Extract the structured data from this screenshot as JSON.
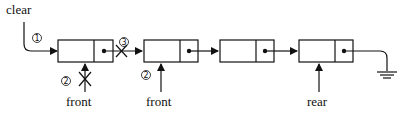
{
  "diagram": {
    "type": "linked-queue-clear",
    "pointer_labels": {
      "clear": "clear",
      "front_old": "front",
      "front_new": "front",
      "rear": "rear"
    },
    "step_markers": {
      "step1": "1",
      "step2_old": "2",
      "step2_new": "2",
      "step3": "3"
    },
    "nodes": [
      {
        "id": "node-1",
        "has_next_pointer": true,
        "link_crossed_out": true
      },
      {
        "id": "node-2",
        "has_next_pointer": true,
        "link_crossed_out": false
      },
      {
        "id": "node-3",
        "has_next_pointer": true,
        "link_crossed_out": false
      },
      {
        "id": "node-4",
        "has_next_pointer": true,
        "terminates_in": "null-ground"
      }
    ],
    "colors": {
      "stroke": "#111111",
      "background": "#ffffff"
    }
  }
}
